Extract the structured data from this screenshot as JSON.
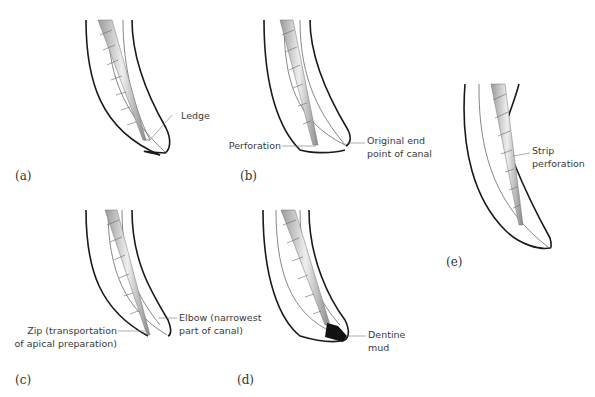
{
  "panels": [
    {
      "id": "a",
      "tag": "(a)",
      "labels": [
        {
          "text": "Ledge"
        }
      ]
    },
    {
      "id": "b",
      "tag": "(b)",
      "labels": [
        {
          "text": "Perforation"
        },
        {
          "text": "Original end"
        },
        {
          "text": "point of canal"
        }
      ]
    },
    {
      "id": "c",
      "tag": "(c)",
      "labels": [
        {
          "text": "Zip (transportation"
        },
        {
          "text": "of apical preparation)"
        },
        {
          "text": "Elbow (narrowest"
        },
        {
          "text": "part of canal)"
        }
      ]
    },
    {
      "id": "d",
      "tag": "(d)",
      "labels": [
        {
          "text": "Dentine"
        },
        {
          "text": "mud"
        }
      ]
    },
    {
      "id": "e",
      "tag": "(e)",
      "labels": [
        {
          "text": "Strip"
        },
        {
          "text": "perforation"
        }
      ]
    }
  ],
  "colors": {
    "outline": "#1a1a1a",
    "thin": "#555555",
    "file": "#bdbdbd",
    "mud": "#111111"
  }
}
